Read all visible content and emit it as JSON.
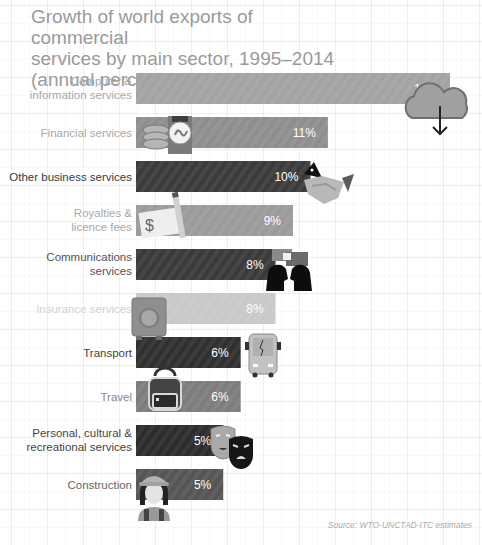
{
  "title_lines": [
    "Growth of world exports of commercial",
    "services by main sector, 1995–2014",
    "(annual percentage change)"
  ],
  "source": "Source: WTO-UNCTAD-ITC estimates",
  "chart_data": {
    "type": "bar",
    "orientation": "horizontal",
    "title": "Growth of world exports of commercial services by main sector, 1995–2014 (annual percentage change)",
    "xlabel": "",
    "ylabel": "",
    "xlim": [
      0,
      18
    ],
    "grid": false,
    "legend": "none",
    "categories": [
      [
        "Computer &",
        "information services"
      ],
      [
        "Financial services"
      ],
      [
        "Other business services"
      ],
      [
        "Royalties &",
        "licence fees"
      ],
      [
        "Communications",
        "services"
      ],
      [
        "Insurance services"
      ],
      [
        "Transport"
      ],
      [
        "Travel"
      ],
      [
        "Personal, cultural &",
        "recreational services"
      ],
      [
        "Construction"
      ]
    ],
    "values": [
      18,
      11,
      10,
      9,
      8,
      8,
      6,
      6,
      5,
      5
    ],
    "value_labels": [
      "18%",
      "11%",
      "10%",
      "9%",
      "8%",
      "8%",
      "6%",
      "6%",
      "5%",
      "5%"
    ],
    "bar_colors": [
      "#a3a3a3",
      "#8e8e8e",
      "#3b3b3b",
      "#9b9b9b",
      "#3a3a3a",
      "#c9c9c9",
      "#303030",
      "#7d7d7d",
      "#2c2c2c",
      "#555555"
    ],
    "label_colors": [
      "#a8a8a8",
      "#a8a8a8",
      "#3a3a3a",
      "#a8a8a8",
      "#555555",
      "#d2d2d2",
      "#444444",
      "#888888",
      "#444444",
      "#666666"
    ],
    "icons": [
      "cloud-download-icon",
      "coins-money-icon",
      "handshake-icon",
      "cheque-pen-icon",
      "people-talking-icon",
      "safe-vault-icon",
      "bus-icon",
      "backpack-icon",
      "theatre-masks-icon",
      "construction-worker-icon"
    ]
  }
}
